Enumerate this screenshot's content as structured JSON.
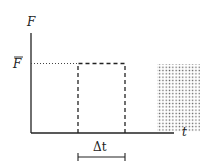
{
  "diagram": {
    "y_axis_label": "F",
    "x_axis_label": "t",
    "level_label": "F̅",
    "level_label_base": "F",
    "interval_label": "Δt",
    "colors": {
      "line": "#222222",
      "dots": "#555555",
      "background": "#ffffff"
    },
    "elements": [
      "y-axis",
      "x-axis",
      "dotted-level-line",
      "dashed-pulse-rectangle",
      "dotted-shaded-region",
      "interval-bracket"
    ]
  }
}
